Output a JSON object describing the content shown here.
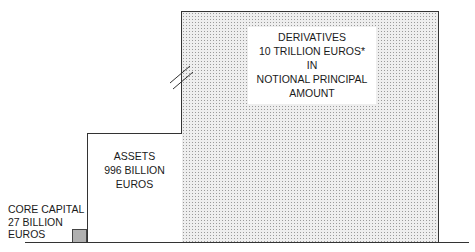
{
  "derivatives": {
    "lines": [
      "DERIVATIVES",
      "10 TRILLION EUROS*",
      "IN",
      "NOTIONAL PRINCIPAL",
      "AMOUNT"
    ]
  },
  "assets": {
    "lines": [
      "ASSETS",
      "996 BILLION",
      "EUROS"
    ]
  },
  "core_capital": {
    "lines": [
      "CORE CAPITAL",
      "27 BILLION",
      "EUROS"
    ]
  },
  "colors": {
    "derivatives_fill": "#eeeeee",
    "core_capital_fill": "#b0b0b0",
    "line": "#333333"
  }
}
